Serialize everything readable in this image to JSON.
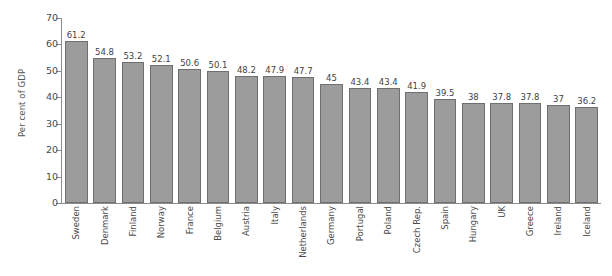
{
  "chart_data": {
    "type": "bar",
    "title": "",
    "xlabel": "",
    "ylabel": "Per cent of GDP",
    "ylim": [
      0,
      70
    ],
    "yticks": [
      0,
      10,
      20,
      30,
      40,
      50,
      60,
      70
    ],
    "grid": false,
    "legend": "none",
    "orientation": "vertical",
    "bar_color": "#9c9c9c",
    "bar_border_color": "#6f6f6f",
    "axis_color": "#8b8b8b",
    "background_color": "#ffffff",
    "data_labels_shown": true,
    "categories": [
      "Sweden",
      "Denmark",
      "Finland",
      "Norway",
      "France",
      "Belgium",
      "Austria",
      "Italy",
      "Netherlands",
      "Germany",
      "Portugal",
      "Poland",
      "Czech Rep.",
      "Spain",
      "Hungary",
      "UK",
      "Greece",
      "Ireland",
      "Iceland"
    ],
    "values": [
      61.2,
      54.8,
      53.2,
      52.1,
      50.6,
      50.1,
      48.2,
      47.9,
      47.7,
      45,
      43.4,
      43.4,
      41.9,
      39.5,
      38,
      37.8,
      37.8,
      37,
      36.2
    ],
    "value_labels": [
      "61.2",
      "54.8",
      "53.2",
      "52.1",
      "50.6",
      "50.1",
      "48.2",
      "47.9",
      "47.7",
      "45",
      "43.4",
      "43.4",
      "41.9",
      "39.5",
      "38",
      "37.8",
      "37.8",
      "37",
      "36.2"
    ],
    "tick_labels": [
      "0",
      "10",
      "20",
      "30",
      "40",
      "50",
      "60",
      "70"
    ]
  }
}
